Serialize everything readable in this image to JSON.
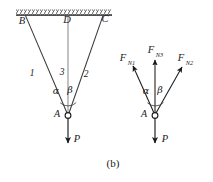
{
  "figure": {
    "caption": "(b)",
    "background_color": "#ffffff",
    "stroke_color": "#1a1a1a",
    "rod_color": "#6e6e6e",
    "left_diagram": {
      "name": "three-bar-truss-structural-diagram",
      "ceiling_label": "hatched-support",
      "nodes": [
        {
          "id": "B",
          "label": "B",
          "x": 22,
          "y": 24
        },
        {
          "id": "D",
          "label": "D",
          "x": 67,
          "y": 23
        },
        {
          "id": "C",
          "label": "C",
          "x": 105,
          "y": 22
        },
        {
          "id": "A",
          "label": "A",
          "x": 57,
          "y": 117
        }
      ],
      "members": [
        {
          "id": "1",
          "label": "1",
          "x": 32,
          "y": 76
        },
        {
          "id": "3",
          "label": "3",
          "x": 62,
          "y": 75
        },
        {
          "id": "2",
          "label": "2",
          "x": 86,
          "y": 77
        }
      ],
      "angles": [
        {
          "id": "alpha",
          "label": "α",
          "x": 56,
          "y": 94
        },
        {
          "id": "beta",
          "label": "β",
          "x": 70,
          "y": 93
        }
      ],
      "load": {
        "label": "P",
        "x": 77,
        "y": 142
      }
    },
    "right_diagram": {
      "name": "free-body-diagram-of-joint-A",
      "forces": [
        {
          "id": "FN1",
          "base": "F",
          "sub": "N1",
          "x": 127,
          "y": 60
        },
        {
          "id": "FN3",
          "base": "F",
          "sub": "N3",
          "x": 155,
          "y": 52
        },
        {
          "id": "FN2",
          "base": "F",
          "sub": "N2",
          "x": 183,
          "y": 60
        }
      ],
      "angles": [
        {
          "id": "alpha",
          "label": "α",
          "x": 149,
          "y": 92
        },
        {
          "id": "beta",
          "label": "β",
          "x": 161,
          "y": 92
        }
      ],
      "node": {
        "id": "A",
        "label": "A",
        "x": 144,
        "y": 117
      },
      "load": {
        "label": "P",
        "x": 167,
        "y": 142
      }
    }
  }
}
